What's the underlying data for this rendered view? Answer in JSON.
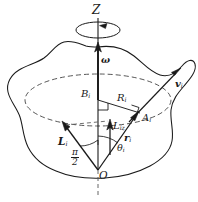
{
  "figure": {
    "colors": {
      "stroke": "#1a1a1a",
      "dashed": "#555555",
      "background": "#ffffff"
    },
    "labels": {
      "axis_z": "Z",
      "omega": "ω",
      "point_b": "B",
      "point_b_sub": "i",
      "radius_r": "R",
      "radius_r_sub": "i",
      "point_a": "A",
      "point_a_sub": "i",
      "velocity": "v",
      "velocity_sub": "i",
      "position": "r",
      "position_sub": "i",
      "angular_momentum": "L",
      "angular_momentum_sub": "i",
      "angular_momentum_z": "L",
      "angular_momentum_z_sub": "iz",
      "theta": "θ",
      "theta_sub": "i",
      "right_angle_num": "π",
      "right_angle_den": "2",
      "origin": "O"
    },
    "geometry": {
      "origin_px": [
        98,
        170
      ],
      "z_axis_top_px": [
        98,
        30
      ],
      "disc_center_px": [
        98,
        100
      ],
      "disc_rx": 73,
      "disc_ry": 26,
      "point_a_px": [
        140,
        113
      ],
      "velocity_tip_px": [
        182,
        68
      ],
      "angular_momentum_tip_px": [
        63,
        122
      ],
      "angular_momentum_z_tip_px": [
        110,
        120
      ],
      "spin_ellipse_center_px": [
        98,
        30
      ],
      "spin_ellipse_rx": 22,
      "spin_ellipse_ry": 8
    }
  }
}
